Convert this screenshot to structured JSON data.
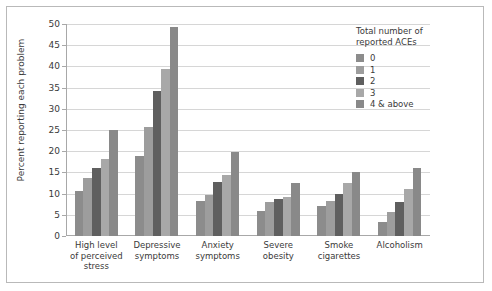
{
  "chart_data": {
    "type": "bar",
    "title": "",
    "xlabel": "",
    "ylabel": "Percent reporting each problem",
    "ylim": [
      0,
      50
    ],
    "ytick_step": 5,
    "yticks": [
      0,
      5,
      10,
      15,
      20,
      25,
      30,
      35,
      40,
      45,
      50
    ],
    "grid": true,
    "legend_position": "right",
    "legend_title": "Total number of\nreported ACEs",
    "categories": [
      "High level\nof perceived\nstress",
      "Depressive\nsymptoms",
      "Anxiety\nsymptoms",
      "Severe\nobesity",
      "Smoke\ncigarettes",
      "Alcoholism"
    ],
    "series": [
      {
        "name": "0",
        "color": "#8c8c8c",
        "values": [
          10.7,
          18.9,
          8.2,
          6.0,
          7.0,
          3.2
        ]
      },
      {
        "name": "1",
        "color": "#9d9d9d",
        "values": [
          13.7,
          25.7,
          9.7,
          8.0,
          8.2,
          5.7
        ]
      },
      {
        "name": "2",
        "color": "#5f5f5f",
        "values": [
          16.1,
          34.3,
          12.8,
          8.8,
          9.8,
          8.0
        ]
      },
      {
        "name": "3",
        "color": "#a8a8a8",
        "values": [
          18.1,
          39.3,
          14.5,
          9.3,
          12.5,
          11.2
        ]
      },
      {
        "name": "4 & above",
        "color": "#898989",
        "values": [
          25.1,
          49.4,
          19.8,
          12.5,
          15.1,
          16.0
        ]
      }
    ]
  }
}
